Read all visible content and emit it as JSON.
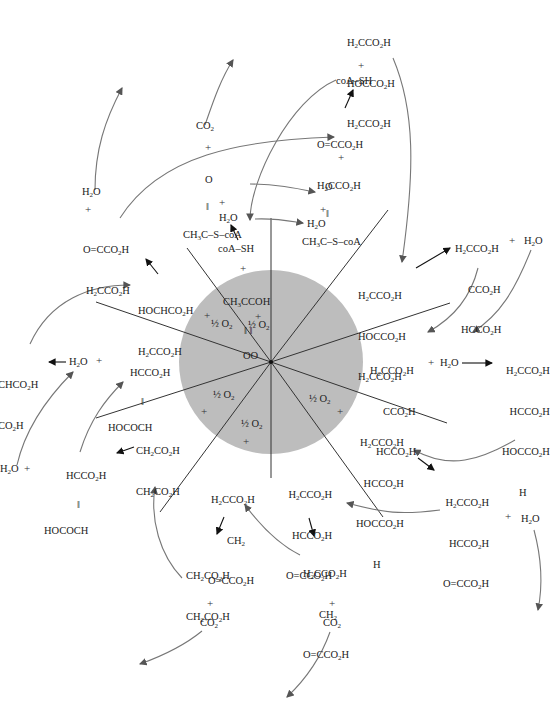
{
  "diagram": {
    "center_circle": {
      "cx": 271,
      "cy": 362,
      "r": 92,
      "fill": "#bdbdbd"
    },
    "center_label": [
      "CH3CCOH",
      "‖ ‖",
      "OO"
    ],
    "half_o2_label": "½ O2",
    "plus": "+",
    "molecules": {
      "citrate_top": [
        "H2CCO2H",
        "HOCCO2H",
        "H2CCO2H"
      ],
      "coa_sh_top": "coA–SH",
      "oxaloacetate_top": [
        "O=CCO2H",
        "H2CCO2H"
      ],
      "acetyl_coa_right": [
        "O",
        "‖",
        "CH3C–S–coA"
      ],
      "h2o_right": "H2O",
      "co2_top": "CO2",
      "acetyl_coa_left": [
        "O",
        "‖",
        "CH3C–S–coA"
      ],
      "h2o_left": "H2O",
      "coa_sh_center": "coA–SH",
      "citrate_right": [
        "H2CCO2H",
        "HOCCO2H",
        "H2CCO2H"
      ],
      "cis_aconitate_top": [
        "H2CCO2H",
        "CCO2H",
        "HCCO2H"
      ],
      "h2o_aconitate": "H2O",
      "cis_aconitate_mid": [
        "H2CCO2H",
        "CCO2H",
        "HCCO2H"
      ],
      "h2o_mid": "H2O",
      "isocitrate_right": [
        "H2CCO2H",
        "HCCO2H",
        "HOCCO2H",
        "H"
      ],
      "isocitrate_mid": [
        "H2CCO2H",
        "HCCO2H",
        "HOCCO2H",
        "H"
      ],
      "oxalosuccinate_right": [
        "H2CCO2H",
        "HCCO2H",
        "O=CCO2H"
      ],
      "h2o_far_right": "H2O",
      "oxalosuccinate_center": [
        "H2CCO2H",
        "HCCO2H",
        "O=CCO2H"
      ],
      "alpha_kg_bottom": [
        "H2CCO2H",
        "CH2",
        "O=CCO2H"
      ],
      "co2_bottom_right": "CO2",
      "alpha_kg_left": [
        "H2CCO2H",
        "CH2",
        "O=CCO2H"
      ],
      "succinate_bottom": [
        "CH2CO2H",
        "CH2CO2H"
      ],
      "co2_bottom_left": "CO2",
      "succinate_left": [
        "CH2CO2H",
        "CH2CO2H"
      ],
      "fumarate_bottom": [
        "HCCO2H",
        "‖",
        "HOCOCH"
      ],
      "h2o_bottom_left": "H2O",
      "fumarate_mid": [
        "HCCO2H",
        "‖",
        "HOCOCH"
      ],
      "h2o_fumarate": "H2O",
      "malate_edge": [
        "CHCO2H",
        "CO2H"
      ],
      "malate_left": [
        "HOCHCO2H",
        "H2CCO2H"
      ],
      "oxaloacetate_left": [
        "O=CCO2H",
        "H2CCO2H"
      ],
      "h2o_top_left": "H2O"
    }
  }
}
